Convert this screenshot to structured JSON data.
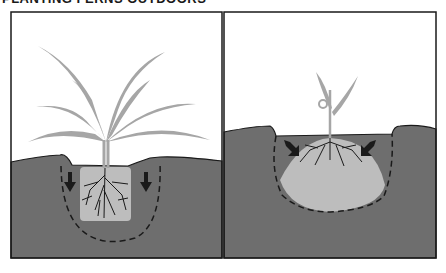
{
  "figure": {
    "title_clipped": "PLANTING FERNS OUTDOORS",
    "colors": {
      "soil": "#6e6e6e",
      "rootball": "#bdbdbd",
      "plant": "#a6a6a6",
      "outline": "#1a1a1a",
      "sky": "#ffffff"
    },
    "panels": [
      {
        "id": "left",
        "description": "Mature fern with square root ball in wide hole; arrows point downward; dashed outline shows hole"
      },
      {
        "id": "right",
        "description": "Young fern with mounded root ball in hole; arrows point diagonally inward; dashed outline shows hole"
      }
    ]
  }
}
